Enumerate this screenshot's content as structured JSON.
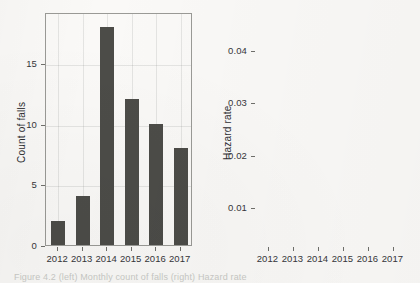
{
  "figure": {
    "caption": "Figure 4.2 (left) Monthly count of falls (right) Hazard rate"
  },
  "chart_data": [
    {
      "id": "count-of-falls",
      "type": "bar",
      "title": "",
      "xlabel": "",
      "ylabel": "Count of falls",
      "categories": [
        "2012",
        "2013",
        "2014",
        "2015",
        "2016",
        "2017"
      ],
      "values": [
        2,
        4,
        18,
        12,
        10,
        8
      ],
      "ylim": [
        0,
        19.2
      ],
      "yticks": [
        0,
        5,
        10,
        15
      ],
      "ytick_labels": [
        "0",
        "5",
        "10",
        "15"
      ],
      "grid": true,
      "legend": "none",
      "bar_color": "#4c4c48",
      "frame_color": "#9a9a96"
    },
    {
      "id": "hazard-rate",
      "type": "line",
      "title": "",
      "xlabel": "",
      "ylabel": "Hazard rate",
      "x": [
        "2012",
        "2013",
        "2014",
        "2015",
        "2016",
        "2017"
      ],
      "values": [
        0.0045,
        0.0218,
        0.043,
        0.0448,
        0.0345,
        0.027
      ],
      "ylim": [
        0.0028,
        0.0472
      ],
      "yticks": [
        0.01,
        0.02,
        0.03,
        0.04
      ],
      "ytick_labels": [
        "0.01",
        "0.02",
        "0.03",
        "0.04"
      ],
      "grid": true,
      "legend": "none",
      "line_color": "#43433f",
      "frame_color": "#9a9a96"
    }
  ]
}
